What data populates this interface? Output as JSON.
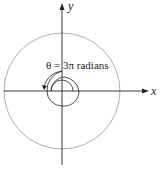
{
  "diagram": {
    "x_label": "x",
    "y_label": "y",
    "annotation": "θ = 3π radians",
    "colors": {
      "axis": "#222222",
      "outer_circle": "#999999",
      "spiral": "#222222"
    }
  }
}
